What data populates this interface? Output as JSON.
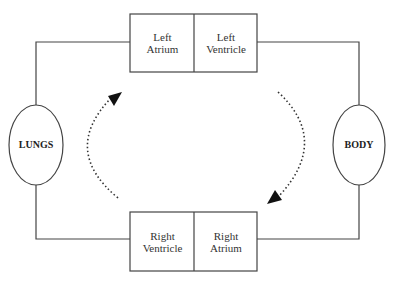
{
  "diagram": {
    "type": "circulation-loop",
    "chambers": {
      "left_atrium": {
        "line1": "Left",
        "line2": "Atrium"
      },
      "left_ventricle": {
        "line1": "Left",
        "line2": "Ventricle"
      },
      "right_ventricle": {
        "line1": "Right",
        "line2": "Ventricle"
      },
      "right_atrium": {
        "line1": "Right",
        "line2": "Atrium"
      }
    },
    "organs": {
      "lungs": "LUNGS",
      "body": "BODY"
    },
    "arrows": [
      {
        "name": "left-arrow",
        "direction": "upward, toward left atrium"
      },
      {
        "name": "right-arrow",
        "direction": "downward, toward right atrium"
      }
    ],
    "colors": {
      "line": "#333333",
      "background": "#ffffff"
    }
  }
}
